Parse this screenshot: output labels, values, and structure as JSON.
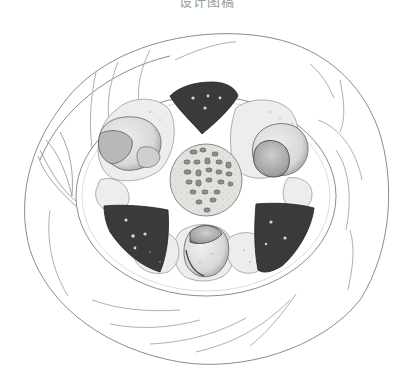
{
  "caption": {
    "text": "设计图稿"
  },
  "illustration": {
    "subject": "pencil sketch of a round plated dish viewed from above",
    "style": "graphite pencil drawing, grayscale",
    "plate": {
      "outer_rim": "wavy folded cloth/napkin ring",
      "inner_well": "oval plate well"
    },
    "center_item": {
      "label": "round textured dumpling with dark bean/seed toppings",
      "toppings_count": 24
    },
    "dark_wedges": [
      {
        "position": "top",
        "color": "#3a3a3a"
      },
      {
        "position": "bottom-left",
        "color": "#3a3a3a"
      },
      {
        "position": "bottom-right",
        "color": "#3a3a3a"
      }
    ],
    "light_pieces": [
      {
        "position": "upper-left",
        "type": "round bun with shaded cap"
      },
      {
        "position": "upper-right",
        "type": "round bun with shaded cap"
      },
      {
        "position": "bottom",
        "type": "round bun with shaded cap"
      }
    ],
    "decoration": "leaf motif on left side of rim",
    "colors": {
      "background": "#ffffff",
      "line": "#8c8c8c",
      "dark_fill": "#3a3a3a",
      "light_fill": "#e6e6e6",
      "mid_fill": "#bdbdbd"
    }
  }
}
